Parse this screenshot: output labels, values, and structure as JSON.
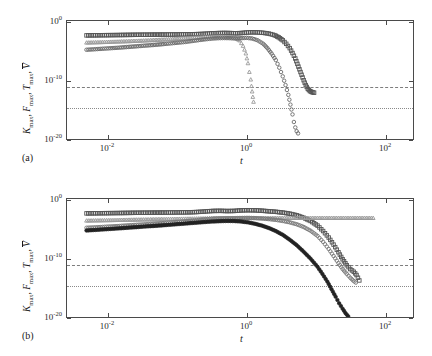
{
  "figure": {
    "axis": {
      "xlabel": "t",
      "ylabel_parts": {
        "k": "K",
        "f": "F",
        "t": "T",
        "v": "V",
        "sub": "max"
      },
      "xticks": [
        {
          "label_mantissa": "10",
          "label_exp": "-2",
          "value": -2
        },
        {
          "label_mantissa": "10",
          "label_exp": "0",
          "value": 0
        },
        {
          "label_mantissa": "10",
          "label_exp": "2",
          "value": 2
        }
      ],
      "yticks": [
        {
          "label_mantissa": "10",
          "label_exp": "0",
          "value": 0
        },
        {
          "label_mantissa": "10",
          "label_exp": "-10",
          "value": -10
        },
        {
          "label_mantissa": "10",
          "label_exp": "-20",
          "value": -20
        }
      ],
      "xlim": [
        -2.6,
        2.4
      ],
      "ylim": [
        -21.5,
        0.6
      ]
    },
    "panels": [
      {
        "id": "(a)",
        "name": "panel-a"
      },
      {
        "id": "(b)",
        "name": "panel-b"
      }
    ],
    "colors": {
      "dark_gray": "#555555",
      "mid_gray": "#777777",
      "light_gray": "#9a9a9a",
      "near_black": "#222222",
      "frame": "#4a4a4a",
      "dashed_ref": "#7d7d7d",
      "dotted_ref": "#8a8a8a"
    }
  },
  "chart_data": [
    {
      "type": "line",
      "panel": "(a)",
      "title": "",
      "xlabel": "t",
      "ylabel": "K_max, F_max, T_max, V̄",
      "xscale": "log10",
      "yscale": "log10",
      "xlim": [
        -2.6,
        2.4
      ],
      "ylim": [
        -21.5,
        0.6
      ],
      "grid": false,
      "legend": "none",
      "reference_lines": [
        {
          "name": "dashed-threshold",
          "style": "dashed",
          "y_log10": -12.4
        },
        {
          "name": "dotted-threshold",
          "style": "dotted",
          "y_log10": -16.0
        }
      ],
      "series": [
        {
          "name": "K_max",
          "marker": "square",
          "color": "#555555",
          "x_log10": [
            -2.32,
            -2.14,
            -1.98,
            -1.84,
            -1.72,
            -1.6,
            -1.5,
            -1.4,
            -1.31,
            -1.22,
            -1.14,
            -1.06,
            -0.98,
            -0.9,
            -0.82,
            -0.74,
            -0.66,
            -0.58,
            -0.5,
            -0.42,
            -0.34,
            -0.26,
            -0.18,
            -0.1,
            -0.02,
            0.06,
            0.14,
            0.22,
            0.3,
            0.38,
            0.44,
            0.5,
            0.55,
            0.6,
            0.64,
            0.68,
            0.71,
            0.74,
            0.77,
            0.8,
            0.83,
            0.86,
            0.89,
            0.92,
            0.95
          ],
          "y_log10": [
            -2.05,
            -2.02,
            -2.0,
            -1.98,
            -1.96,
            -1.94,
            -1.93,
            -1.92,
            -1.91,
            -1.9,
            -1.89,
            -1.88,
            -1.87,
            -1.86,
            -1.84,
            -1.82,
            -1.78,
            -1.72,
            -1.66,
            -1.62,
            -1.6,
            -1.62,
            -1.66,
            -1.62,
            -1.52,
            -1.48,
            -1.5,
            -1.58,
            -1.72,
            -2.0,
            -2.4,
            -2.95,
            -3.6,
            -4.4,
            -5.3,
            -6.3,
            -7.3,
            -8.3,
            -9.3,
            -10.3,
            -11.2,
            -11.9,
            -12.3,
            -12.5,
            -12.6
          ]
        },
        {
          "name": "F_max",
          "marker": "triangle",
          "color": "#9a9a9a",
          "x_log10": [
            -2.32,
            -2.14,
            -1.98,
            -1.84,
            -1.72,
            -1.6,
            -1.5,
            -1.4,
            -1.31,
            -1.22,
            -1.14,
            -1.06,
            -0.98,
            -0.9,
            -0.82,
            -0.74,
            -0.66,
            -0.58,
            -0.5,
            -0.42,
            -0.34,
            -0.26,
            -0.18,
            -0.12,
            -0.07,
            -0.03,
            0.0,
            0.02,
            0.04,
            0.05,
            0.06,
            0.07,
            0.08
          ],
          "y_log10": [
            -3.4,
            -3.33,
            -3.26,
            -3.2,
            -3.14,
            -3.08,
            -3.02,
            -2.96,
            -2.9,
            -2.84,
            -2.78,
            -2.72,
            -2.66,
            -2.6,
            -2.54,
            -2.48,
            -2.42,
            -2.36,
            -2.32,
            -2.3,
            -2.32,
            -2.36,
            -2.5,
            -3.0,
            -4.0,
            -5.4,
            -7.2,
            -8.8,
            -10.2,
            -11.4,
            -12.4,
            -13.4,
            -14.3
          ]
        },
        {
          "name": "T_max",
          "marker": "circle",
          "color": "#6a6a6a",
          "x_log10": [
            -2.32,
            -2.14,
            -1.98,
            -1.84,
            -1.72,
            -1.6,
            -1.5,
            -1.4,
            -1.31,
            -1.22,
            -1.14,
            -1.06,
            -0.98,
            -0.9,
            -0.82,
            -0.74,
            -0.66,
            -0.58,
            -0.5,
            -0.42,
            -0.34,
            -0.26,
            -0.18,
            -0.1,
            -0.02,
            0.06,
            0.14,
            0.22,
            0.28,
            0.34,
            0.4,
            0.45,
            0.5,
            0.54,
            0.58,
            0.61,
            0.64,
            0.66,
            0.68,
            0.7,
            0.72
          ],
          "y_log10": [
            -4.7,
            -4.55,
            -4.42,
            -4.3,
            -4.18,
            -4.06,
            -3.96,
            -3.86,
            -3.76,
            -3.66,
            -3.56,
            -3.46,
            -3.36,
            -3.26,
            -3.12,
            -2.98,
            -2.84,
            -2.72,
            -2.62,
            -2.56,
            -2.54,
            -2.56,
            -2.62,
            -2.56,
            -2.5,
            -2.62,
            -2.96,
            -3.6,
            -4.4,
            -5.4,
            -6.6,
            -8.0,
            -9.6,
            -11.2,
            -13.0,
            -14.8,
            -16.6,
            -18.0,
            -19.0,
            -19.7,
            -20.1
          ]
        }
      ]
    },
    {
      "type": "line",
      "panel": "(b)",
      "title": "",
      "xlabel": "t",
      "ylabel": "K_max, F_max, T_max, V̄",
      "xscale": "log10",
      "yscale": "log10",
      "xlim": [
        -2.6,
        2.4
      ],
      "ylim": [
        -21.5,
        0.6
      ],
      "grid": false,
      "legend": "none",
      "reference_lines": [
        {
          "name": "dashed-threshold",
          "style": "dashed",
          "y_log10": -12.4
        },
        {
          "name": "dotted-threshold",
          "style": "dotted",
          "y_log10": -16.0
        }
      ],
      "series": [
        {
          "name": "K_max",
          "marker": "square",
          "color": "#555555",
          "x_log10": [
            -2.32,
            -2.14,
            -1.98,
            -1.84,
            -1.72,
            -1.6,
            -1.5,
            -1.4,
            -1.31,
            -1.22,
            -1.14,
            -1.06,
            -0.98,
            -0.9,
            -0.82,
            -0.74,
            -0.66,
            -0.58,
            -0.5,
            -0.4,
            -0.3,
            -0.2,
            -0.1,
            0.0,
            0.1,
            0.2,
            0.3,
            0.4,
            0.5,
            0.6,
            0.7,
            0.8,
            0.9,
            1.0,
            1.08,
            1.16,
            1.23,
            1.3,
            1.36,
            1.42,
            1.47,
            1.52,
            1.56,
            1.6
          ],
          "y_log10": [
            -2.05,
            -2.02,
            -2.0,
            -1.98,
            -1.96,
            -1.94,
            -1.93,
            -1.92,
            -1.91,
            -1.9,
            -1.89,
            -1.88,
            -1.87,
            -1.86,
            -1.84,
            -1.8,
            -1.74,
            -1.66,
            -1.6,
            -1.58,
            -1.62,
            -1.6,
            -1.5,
            -1.46,
            -1.48,
            -1.56,
            -1.66,
            -1.76,
            -1.9,
            -2.1,
            -2.4,
            -2.85,
            -3.45,
            -4.3,
            -5.3,
            -6.5,
            -7.8,
            -9.2,
            -10.5,
            -11.6,
            -12.3,
            -12.8,
            -13.4,
            -14.4
          ]
        },
        {
          "name": "F_max",
          "marker": "triangle",
          "color": "#9a9a9a",
          "x_log10": [
            -2.32,
            -2.14,
            -1.98,
            -1.84,
            -1.72,
            -1.6,
            -1.5,
            -1.4,
            -1.31,
            -1.22,
            -1.14,
            -1.06,
            -0.98,
            -0.9,
            -0.82,
            -0.74,
            -0.66,
            -0.58,
            -0.5,
            -0.4,
            -0.3,
            -0.2,
            -0.1,
            0.0,
            0.1,
            0.2,
            0.3,
            0.4,
            0.5,
            0.6,
            0.7,
            0.8,
            0.9,
            1.0,
            1.1,
            1.2,
            1.3,
            1.4,
            1.5,
            1.6,
            1.7,
            1.8
          ],
          "y_log10": [
            -3.4,
            -3.36,
            -3.32,
            -3.28,
            -3.25,
            -3.22,
            -3.2,
            -3.18,
            -3.16,
            -3.14,
            -3.12,
            -3.1,
            -3.08,
            -3.06,
            -3.04,
            -3.02,
            -3.0,
            -2.98,
            -2.96,
            -2.94,
            -2.92,
            -2.92,
            -2.92,
            -2.92,
            -2.92,
            -2.92,
            -2.92,
            -2.92,
            -2.92,
            -2.92,
            -2.92,
            -2.92,
            -2.92,
            -2.92,
            -2.92,
            -2.92,
            -2.92,
            -2.92,
            -2.92,
            -2.92,
            -2.92,
            -2.92
          ]
        },
        {
          "name": "T_max",
          "marker": "circle",
          "color": "#787878",
          "x_log10": [
            -2.32,
            -2.14,
            -1.98,
            -1.84,
            -1.72,
            -1.6,
            -1.5,
            -1.4,
            -1.31,
            -1.22,
            -1.14,
            -1.06,
            -0.98,
            -0.9,
            -0.82,
            -0.74,
            -0.66,
            -0.58,
            -0.5,
            -0.4,
            -0.3,
            -0.2,
            -0.1,
            0.0,
            0.1,
            0.2,
            0.3,
            0.4,
            0.5,
            0.6,
            0.7,
            0.8,
            0.9,
            1.0,
            1.08,
            1.16,
            1.23,
            1.3,
            1.36,
            1.42,
            1.47,
            1.51,
            1.55
          ],
          "y_log10": [
            -4.7,
            -4.58,
            -4.46,
            -4.36,
            -4.26,
            -4.16,
            -4.08,
            -4.0,
            -3.92,
            -3.84,
            -3.76,
            -3.68,
            -3.6,
            -3.5,
            -3.4,
            -3.3,
            -3.2,
            -3.1,
            -3.02,
            -2.96,
            -2.94,
            -2.94,
            -2.9,
            -2.88,
            -2.92,
            -3.0,
            -3.1,
            -3.24,
            -3.44,
            -3.7,
            -4.05,
            -4.55,
            -5.25,
            -6.2,
            -7.3,
            -8.6,
            -9.9,
            -11.2,
            -12.3,
            -13.2,
            -13.9,
            -14.4,
            -14.8
          ]
        },
        {
          "name": "V_bar",
          "marker": "circle-filled",
          "color": "#222222",
          "x_log10": [
            -2.32,
            -2.14,
            -1.98,
            -1.84,
            -1.72,
            -1.6,
            -1.5,
            -1.4,
            -1.31,
            -1.22,
            -1.14,
            -1.06,
            -0.98,
            -0.9,
            -0.82,
            -0.74,
            -0.66,
            -0.58,
            -0.5,
            -0.4,
            -0.3,
            -0.2,
            -0.1,
            0.0,
            0.1,
            0.2,
            0.3,
            0.4,
            0.5,
            0.6,
            0.7,
            0.8,
            0.9,
            1.0,
            1.07,
            1.14,
            1.2,
            1.26,
            1.31,
            1.36,
            1.4,
            1.44
          ],
          "y_log10": [
            -5.2,
            -5.05,
            -4.92,
            -4.8,
            -4.68,
            -4.58,
            -4.48,
            -4.4,
            -4.32,
            -4.24,
            -4.16,
            -4.08,
            -4.0,
            -3.92,
            -3.84,
            -3.76,
            -3.68,
            -3.6,
            -3.54,
            -3.48,
            -3.44,
            -3.46,
            -3.54,
            -3.7,
            -3.96,
            -4.3,
            -4.74,
            -5.3,
            -6.0,
            -6.9,
            -7.9,
            -9.1,
            -10.4,
            -11.9,
            -13.2,
            -14.6,
            -16.0,
            -17.4,
            -18.6,
            -19.6,
            -20.4,
            -21.0
          ]
        }
      ]
    }
  ]
}
